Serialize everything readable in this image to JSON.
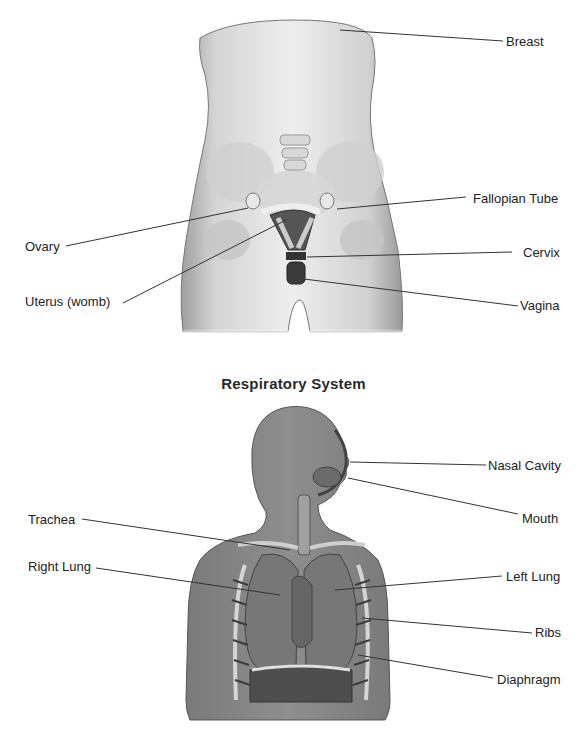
{
  "reproductive": {
    "labels": {
      "breast": "Breast",
      "fallopian_tube": "Fallopian Tube",
      "ovary": "Ovary",
      "cervix": "Cervix",
      "uterus": "Uterus (womb)",
      "vagina": "Vagina"
    }
  },
  "respiratory": {
    "title": "Respiratory System",
    "labels": {
      "nasal_cavity": "Nasal Cavity",
      "mouth": "Mouth",
      "trachea": "Trachea",
      "right_lung": "Right Lung",
      "left_lung": "Left Lung",
      "ribs": "Ribs",
      "diaphragm": "Diaphragm"
    }
  },
  "colors": {
    "skin_light": "#e6e6e6",
    "skin_mid": "#bdbdbd",
    "silhouette": "#8a8a8a",
    "organ_dark": "#4a4a4a",
    "leader": "#333333"
  }
}
